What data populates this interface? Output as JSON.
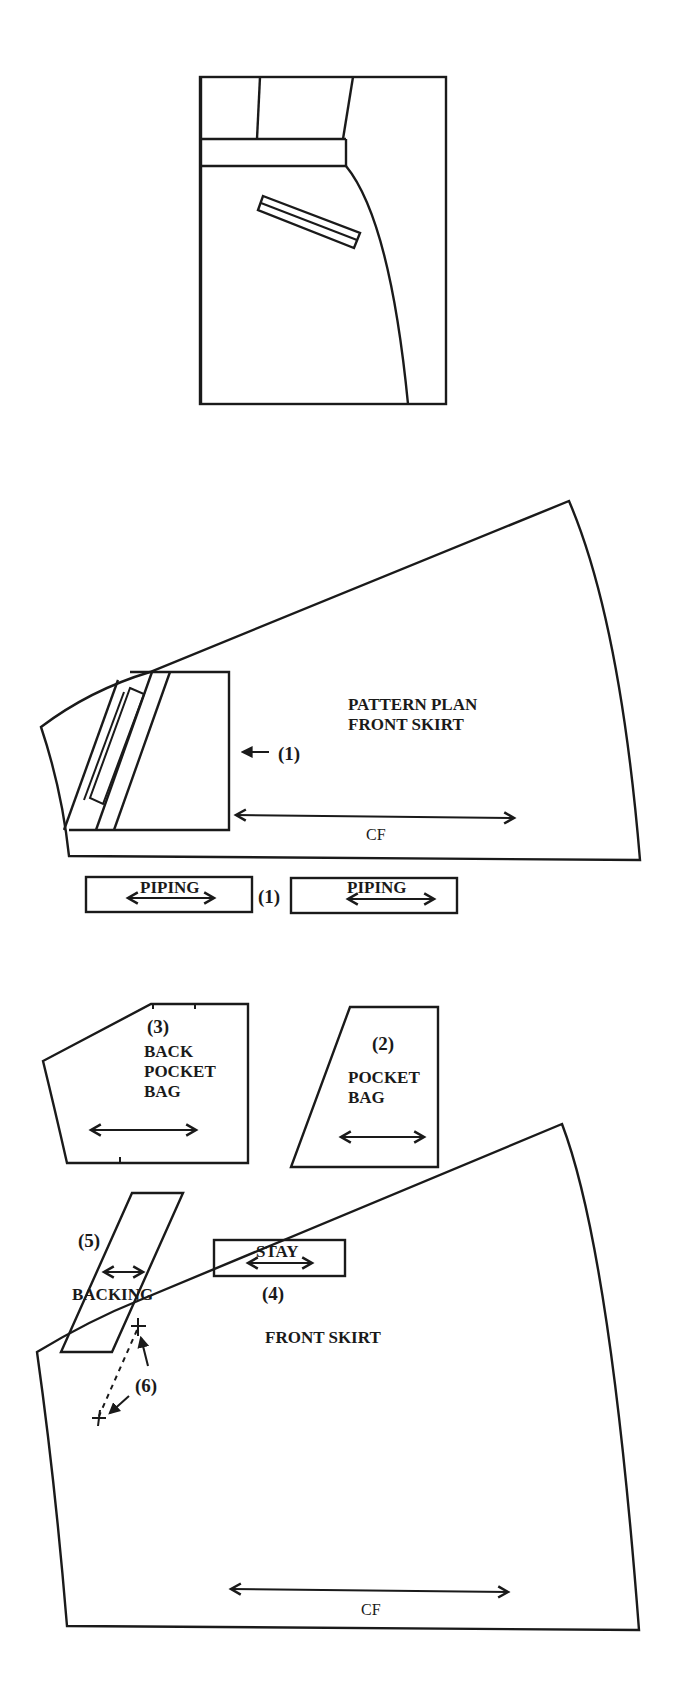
{
  "figure": {
    "sketch": {
      "name": "skirt-front-sketch"
    },
    "pattern_plan": {
      "title_line1": "PATTERN PLAN",
      "title_line2": "FRONT SKIRT",
      "callout": "(1)",
      "grain_label": "CF"
    },
    "pieces": {
      "piping_left": {
        "label": "PIPING"
      },
      "piping_number": "(1)",
      "piping_right": {
        "label": "PIPING"
      },
      "back_pocket_bag": {
        "number": "(3)",
        "line1": "BACK",
        "line2": "POCKET",
        "line3": "BAG"
      },
      "pocket_bag": {
        "number": "(2)",
        "line1": "POCKET",
        "line2": "BAG"
      },
      "backing": {
        "number": "(5)",
        "label": "BACKING"
      },
      "stay": {
        "number": "(4)",
        "label": "STAY"
      }
    },
    "front_skirt": {
      "title": "FRONT SKIRT",
      "marker": "(6)",
      "grain_label": "CF"
    },
    "colors": {
      "line": "#1a1a1a",
      "background": "#ffffff"
    }
  }
}
